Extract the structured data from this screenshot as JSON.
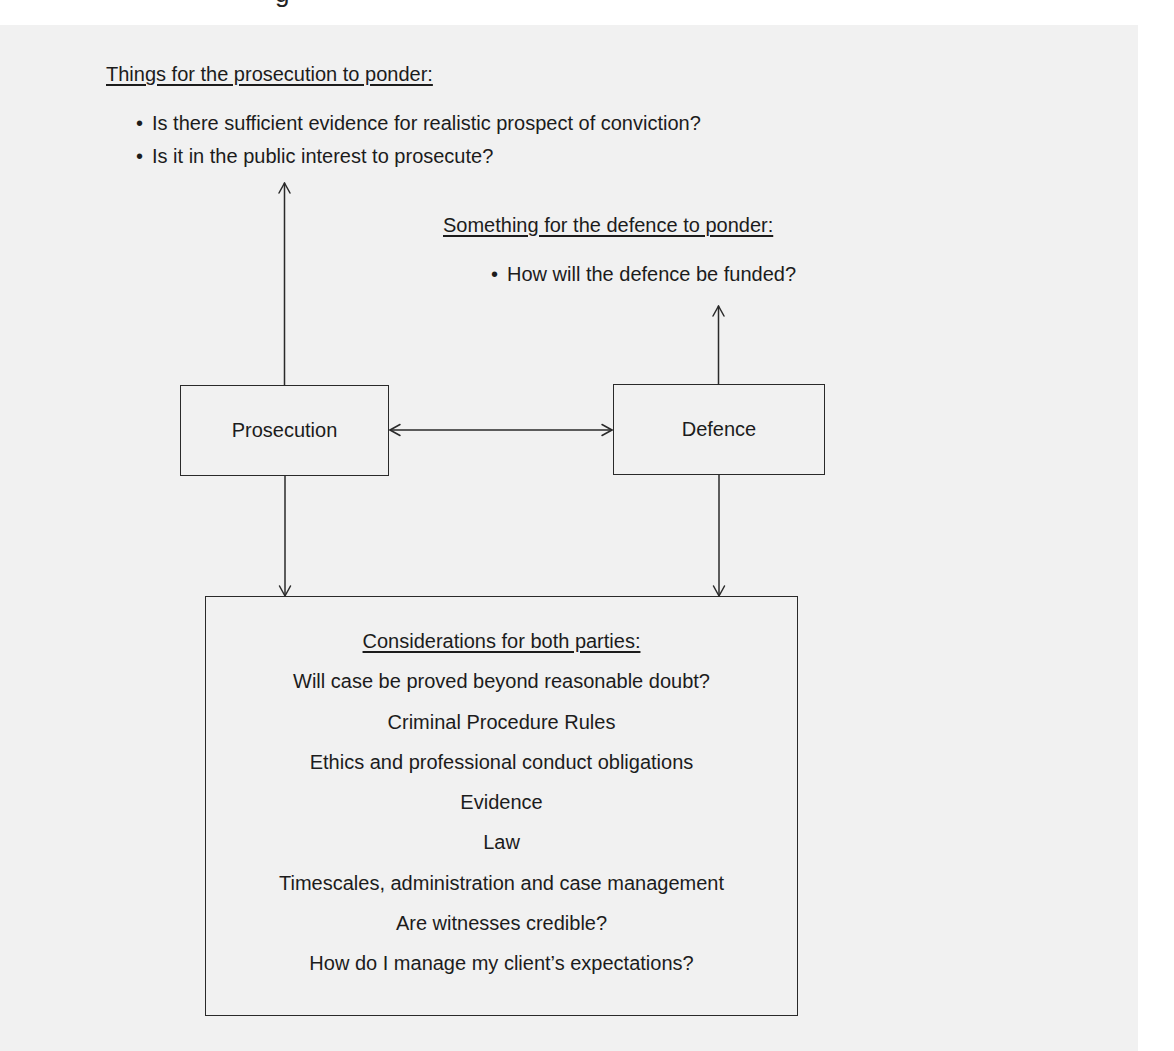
{
  "top_cutoff_text": "g",
  "prosecution_panel": {
    "heading": "Things for the prosecution to ponder:",
    "bullets": [
      "Is there sufficient evidence for realistic prospect of conviction?",
      "Is it in the public interest to prosecute?"
    ]
  },
  "defence_panel": {
    "heading": "Something for the defence to ponder:",
    "bullets": [
      "How will the defence be funded?"
    ]
  },
  "nodes": {
    "prosecution": "Prosecution",
    "defence": "Defence"
  },
  "considerations": {
    "heading": "Considerations for both parties:",
    "items": [
      "Will case be proved beyond reasonable doubt?",
      "Criminal Procedure Rules",
      "Ethics and professional conduct obligations",
      "Evidence",
      "Law",
      "Timescales, administration and case management",
      "Are witnesses credible?",
      "How do I manage my client’s expectations?"
    ]
  },
  "bullet_glyph": "•",
  "colors": {
    "panel_background": "#f1f1f1",
    "line": "#2a2a2a",
    "text": "#1c1c1c"
  },
  "edges": [
    {
      "from": "prosecution",
      "to": "prosecution_panel",
      "type": "arrow-up"
    },
    {
      "from": "defence",
      "to": "defence_panel",
      "type": "arrow-up"
    },
    {
      "from": "prosecution",
      "to": "defence",
      "type": "double-arrow"
    },
    {
      "from": "prosecution",
      "to": "considerations",
      "type": "arrow-down"
    },
    {
      "from": "defence",
      "to": "considerations",
      "type": "arrow-down"
    }
  ]
}
